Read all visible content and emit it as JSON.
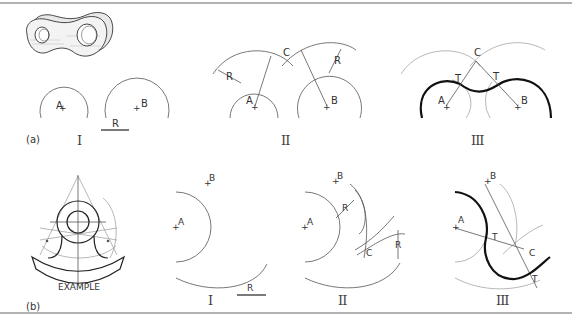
{
  "figure": {
    "type": "technical-drawing",
    "parts": [
      {
        "id": "a",
        "label": "(a)",
        "steps": [
          {
            "numeral": "I",
            "points": [
              "A",
              "B"
            ],
            "dimension_label": "R"
          },
          {
            "numeral": "II",
            "points": [
              "A",
              "B",
              "C"
            ],
            "dimension_labels": [
              "R",
              "R"
            ]
          },
          {
            "numeral": "III",
            "points": [
              "A",
              "B",
              "C"
            ],
            "tangent_labels": [
              "T",
              "T"
            ]
          }
        ]
      },
      {
        "id": "b",
        "label": "(b)",
        "example_caption": "EXAMPLE",
        "steps": [
          {
            "numeral": "I",
            "points": [
              "A",
              "B"
            ],
            "dimension_label": "R"
          },
          {
            "numeral": "II",
            "points": [
              "A",
              "B",
              "C"
            ],
            "dimension_labels": [
              "R",
              "R"
            ]
          },
          {
            "numeral": "III",
            "points": [
              "A",
              "B",
              "C"
            ],
            "tangent_labels": [
              "T",
              "T"
            ]
          }
        ]
      }
    ]
  },
  "labels": {
    "a_part": "(a)",
    "b_part": "(b)",
    "example": "EXAMPLE",
    "A": "A",
    "B": "B",
    "C": "C",
    "R": "R",
    "T": "T",
    "I": "I",
    "II": "II",
    "III": "III"
  },
  "colors": {
    "line": "#555555",
    "heavy": "#111111",
    "construction": "#999999",
    "background": "#ffffff"
  }
}
